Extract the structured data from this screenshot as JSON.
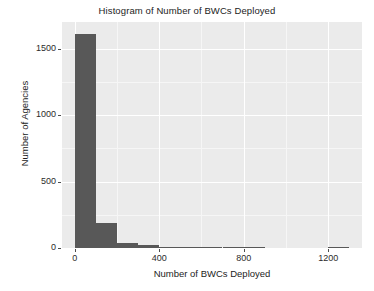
{
  "chart_data": {
    "type": "bar",
    "title": "Histogram of Number of BWCs Deployed",
    "xlabel": "Number of BWCs Deployed",
    "ylabel": "Number of Agencies",
    "xlim": [
      -60,
      1360
    ],
    "ylim": [
      0,
      1700
    ],
    "grid": true,
    "legend": null,
    "bin_width": 100,
    "x_ticks": [
      0,
      400,
      800,
      1200
    ],
    "x_tick_labels": [
      "0",
      "400",
      "800",
      "1200"
    ],
    "y_ticks": [
      0,
      500,
      1000,
      1500
    ],
    "y_tick_labels": [
      "0",
      "500",
      "1000",
      "1500"
    ],
    "bar_color": "#585858",
    "panel_color": "#ebebeb",
    "gridline_color": "#ffffff",
    "bins": [
      {
        "x0": 0,
        "x1": 100,
        "center": 50,
        "value": 1610
      },
      {
        "x0": 100,
        "x1": 200,
        "center": 150,
        "value": 185
      },
      {
        "x0": 200,
        "x1": 300,
        "center": 250,
        "value": 40
      },
      {
        "x0": 300,
        "x1": 400,
        "center": 350,
        "value": 22
      },
      {
        "x0": 400,
        "x1": 500,
        "center": 450,
        "value": 10
      },
      {
        "x0": 500,
        "x1": 600,
        "center": 550,
        "value": 8
      },
      {
        "x0": 600,
        "x1": 700,
        "center": 650,
        "value": 5
      },
      {
        "x0": 700,
        "x1": 800,
        "center": 750,
        "value": 5
      },
      {
        "x0": 800,
        "x1": 900,
        "center": 850,
        "value": 4
      },
      {
        "x0": 900,
        "x1": 1000,
        "center": 950,
        "value": 0
      },
      {
        "x0": 1000,
        "x1": 1100,
        "center": 1050,
        "value": 0
      },
      {
        "x0": 1100,
        "x1": 1200,
        "center": 1150,
        "value": 0
      },
      {
        "x0": 1200,
        "x1": 1300,
        "center": 1250,
        "value": 6
      }
    ],
    "categories": [
      "0-100",
      "100-200",
      "200-300",
      "300-400",
      "400-500",
      "500-600",
      "600-700",
      "700-800",
      "800-900",
      "900-1000",
      "1000-1100",
      "1100-1200",
      "1200-1300"
    ],
    "values": [
      1610,
      185,
      40,
      22,
      10,
      8,
      5,
      5,
      4,
      0,
      0,
      0,
      6
    ]
  }
}
